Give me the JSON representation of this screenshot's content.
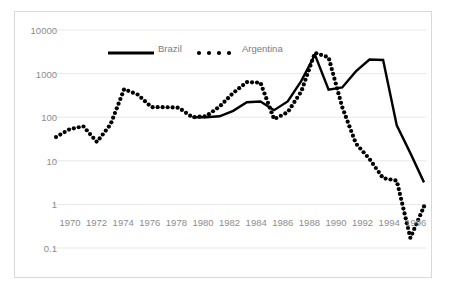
{
  "chart": {
    "title": "",
    "background_color": "#ffffff",
    "border_color": "#d9d9d9",
    "gridline_color": "#e8e8e8",
    "label_color": "#8c8c8c",
    "series_color": "#000000"
  },
  "legend": {
    "position": "top-center-inside",
    "entries": [
      {
        "label": "Brazil",
        "marker": "solid-line"
      },
      {
        "label": "Argentina",
        "marker": "dotted-markers"
      }
    ]
  },
  "axes": {
    "y_ticks": [
      "10000",
      "1000",
      "100",
      "10",
      "1",
      "0.1"
    ],
    "x_ticks": [
      "1970",
      "1972",
      "1974",
      "1976",
      "1978",
      "1980",
      "1982",
      "1984",
      "1986",
      "1988",
      "1990",
      "1992",
      "1994",
      "1996"
    ]
  },
  "chart_data": {
    "type": "line",
    "title": "",
    "xlabel": "",
    "ylabel": "",
    "yscale": "log",
    "ylim": [
      0.1,
      10000
    ],
    "xlim": [
      1970,
      1997
    ],
    "grid": true,
    "legend_position": "top-center",
    "x": [
      1970,
      1971,
      1972,
      1973,
      1974,
      1975,
      1976,
      1977,
      1978,
      1979,
      1980,
      1981,
      1982,
      1983,
      1984,
      1985,
      1986,
      1987,
      1988,
      1989,
      1990,
      1991,
      1992,
      1993,
      1994,
      1995,
      1996,
      1997
    ],
    "series": [
      {
        "name": "Brazil",
        "style": "solid-line",
        "x": [
          1980,
          1981,
          1982,
          1983,
          1984,
          1985,
          1986,
          1987,
          1988,
          1989,
          1990,
          1991,
          1992,
          1993,
          1994,
          1995,
          1996,
          1997
        ],
        "values": [
          100,
          100,
          105,
          140,
          220,
          230,
          145,
          230,
          680,
          2700,
          430,
          480,
          1120,
          2100,
          2050,
          65,
          15,
          3.2
        ]
      },
      {
        "name": "Argentina",
        "style": "dotted-markers",
        "x": [
          1970,
          1971,
          1972,
          1973,
          1974,
          1975,
          1976,
          1977,
          1978,
          1979,
          1980,
          1981,
          1982,
          1983,
          1984,
          1985,
          1986,
          1987,
          1988,
          1989,
          1990,
          1991,
          1992,
          1993,
          1994,
          1995,
          1996,
          1997
        ],
        "values": [
          35,
          53,
          62,
          27,
          68,
          440,
          330,
          170,
          170,
          165,
          100,
          105,
          175,
          360,
          640,
          620,
          90,
          130,
          390,
          3000,
          2350,
          170,
          25,
          11,
          4,
          3.5,
          0.17,
          0.9
        ]
      }
    ]
  }
}
